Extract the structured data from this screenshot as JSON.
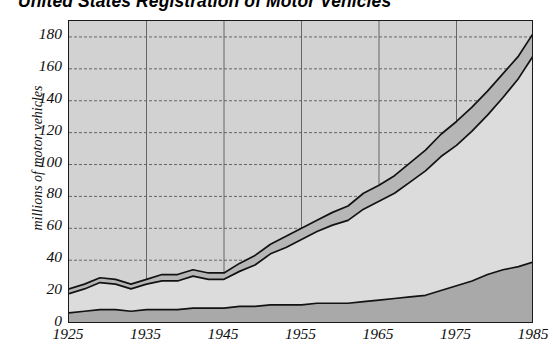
{
  "chart_data": {
    "type": "area",
    "title": "United States Registration of Motor Vehicles",
    "xlabel": "",
    "ylabel": "millions of motor vehicles",
    "stacked": true,
    "grid": true,
    "legend_position": "none",
    "xlim": [
      1925,
      1985
    ],
    "ylim": [
      0,
      190
    ],
    "ytick_values": [
      0,
      20,
      40,
      60,
      80,
      100,
      120,
      140,
      160,
      180
    ],
    "ytick_labels": [
      "0",
      "20",
      "40",
      "60",
      "80",
      "100",
      "120",
      "140",
      "160",
      "180"
    ],
    "xtick_values": [
      1925,
      1935,
      1945,
      1955,
      1965,
      1975,
      1985
    ],
    "xtick_labels": [
      "1925",
      "1935",
      "1945",
      "1955",
      "1965",
      "1975",
      "1985"
    ],
    "x": [
      1925,
      1927,
      1929,
      1931,
      1933,
      1935,
      1937,
      1939,
      1941,
      1943,
      1945,
      1947,
      1949,
      1951,
      1953,
      1955,
      1957,
      1959,
      1961,
      1963,
      1965,
      1967,
      1969,
      1971,
      1973,
      1975,
      1977,
      1979,
      1981,
      1983,
      1985
    ],
    "series": [
      {
        "name": "trucks-and-buses",
        "color": "#a8a8a8",
        "values": [
          7,
          8,
          9,
          9,
          8,
          9,
          9,
          9,
          10,
          10,
          10,
          11,
          11,
          12,
          12,
          12,
          13,
          13,
          13,
          14,
          15,
          16,
          17,
          18,
          21,
          24,
          27,
          31,
          34,
          36,
          39
        ]
      },
      {
        "name": "automobiles",
        "color": "#d9d9d9",
        "values": [
          12,
          14,
          17,
          16,
          14,
          16,
          18,
          18,
          20,
          18,
          18,
          22,
          26,
          32,
          36,
          41,
          45,
          49,
          52,
          58,
          62,
          66,
          72,
          78,
          84,
          88,
          94,
          100,
          108,
          118,
          130
        ]
      },
      {
        "name": "all-other-vehicles",
        "color": "#b5b5b5",
        "values": [
          22,
          25,
          28,
          27,
          24,
          27,
          30,
          31,
          34,
          31,
          31,
          38,
          44,
          52,
          58,
          63,
          68,
          74,
          79,
          87,
          92,
          98,
          106,
          114,
          124,
          132,
          140,
          148,
          156,
          165,
          173
        ]
      }
    ],
    "series_cumulative_top": {
      "band1_top": [
        7,
        8,
        9,
        9,
        8,
        9,
        9,
        9,
        10,
        10,
        10,
        11,
        11,
        12,
        12,
        12,
        13,
        13,
        13,
        14,
        15,
        16,
        17,
        18,
        21,
        24,
        27,
        31,
        34,
        36,
        39
      ],
      "band2_top": [
        19,
        22,
        26,
        25,
        22,
        25,
        27,
        27,
        30,
        28,
        28,
        33,
        37,
        44,
        48,
        53,
        58,
        62,
        65,
        72,
        77,
        82,
        89,
        96,
        105,
        112,
        121,
        131,
        142,
        154,
        169
      ],
      "band3_top": [
        22,
        25,
        29,
        28,
        25,
        28,
        31,
        31,
        34,
        32,
        32,
        38,
        43,
        50,
        55,
        60,
        65,
        70,
        74,
        82,
        87,
        93,
        101,
        109,
        119,
        127,
        136,
        146,
        157,
        168,
        183
      ]
    }
  },
  "chart": {
    "title": "United States Registration of Motor Vehicles",
    "ylabel": "millions of motor vehicles"
  },
  "colors": {
    "band_bottom": "#a9a9a9",
    "band_middle": "#dcdcdc",
    "band_top": "#b6b6b6",
    "plot_background": "#d2d2d2",
    "axis_line": "#1a1a1a",
    "gridline": "#5a5a5a",
    "text": "#0d0d0d"
  }
}
